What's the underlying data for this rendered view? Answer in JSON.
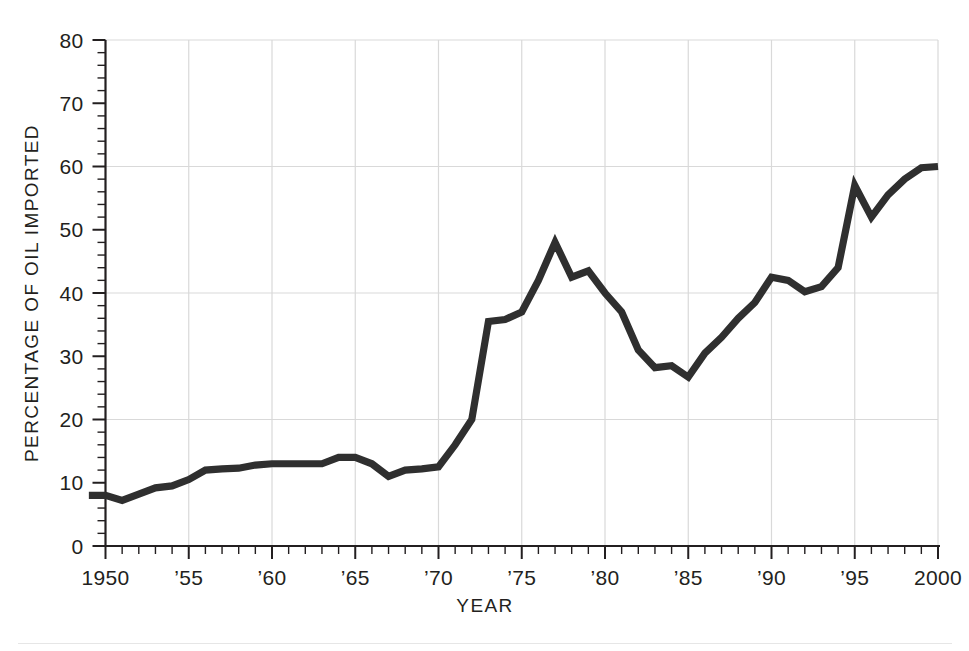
{
  "chart_data": {
    "type": "line",
    "title": "",
    "xlabel": "YEAR",
    "ylabel": "PERCENTAGE OF OIL IMPORTED",
    "xlim": [
      1949,
      2000
    ],
    "ylim": [
      0,
      80
    ],
    "grid": "horizontal gridlines at 20, 40, 60, 80; vertical gridlines at 1955, 1960, 1965, 1970, 1975, 1980, 1985, 1990, 1995, 2000",
    "legend": "none",
    "y_ticks_major": [
      0,
      10,
      20,
      30,
      40,
      50,
      60,
      70,
      80
    ],
    "y_tick_labels": [
      "0",
      "10",
      "20",
      "30",
      "40",
      "50",
      "60",
      "70",
      "80"
    ],
    "y_minor_tick_step": 2,
    "x_ticks_major": [
      1950,
      1955,
      1960,
      1965,
      1970,
      1975,
      1980,
      1985,
      1990,
      1995,
      2000
    ],
    "x_tick_labels": [
      "1950",
      "’55",
      "’60",
      "’65",
      "’70",
      "’75",
      "’80",
      "’85",
      "’90",
      "’95",
      "2000"
    ],
    "x_minor_tick_step": 1,
    "series": [
      {
        "name": "Percentage of oil imported",
        "color": "#2f2f2f",
        "x": [
          1949,
          1950,
          1951,
          1952,
          1953,
          1954,
          1955,
          1956,
          1957,
          1958,
          1959,
          1960,
          1961,
          1962,
          1963,
          1964,
          1965,
          1966,
          1967,
          1968,
          1969,
          1970,
          1971,
          1972,
          1973,
          1974,
          1975,
          1976,
          1977,
          1978,
          1979,
          1980,
          1981,
          1982,
          1983,
          1984,
          1985,
          1986,
          1987,
          1988,
          1989,
          1990,
          1991,
          1992,
          1993,
          1994,
          1995,
          1996,
          1997,
          1998,
          1999,
          2000
        ],
        "values": [
          8.0,
          8.0,
          7.2,
          8.2,
          9.2,
          9.5,
          10.5,
          12.0,
          12.2,
          12.3,
          12.8,
          13.0,
          13.0,
          13.0,
          13.0,
          14.0,
          14.0,
          13.0,
          11.0,
          12.0,
          12.2,
          12.5,
          16.0,
          20.0,
          35.5,
          35.8,
          37.0,
          42.0,
          48.0,
          42.5,
          43.5,
          40.0,
          37.0,
          31.0,
          28.2,
          28.5,
          26.7,
          30.5,
          33.0,
          36.0,
          38.5,
          42.5,
          42.0,
          40.2,
          41.0,
          44.0,
          57.0,
          52.0,
          55.5,
          58.0,
          59.8,
          60.0
        ]
      }
    ]
  },
  "axes": {
    "y_title": "PERCENTAGE OF OIL IMPORTED",
    "x_title": "YEAR"
  }
}
